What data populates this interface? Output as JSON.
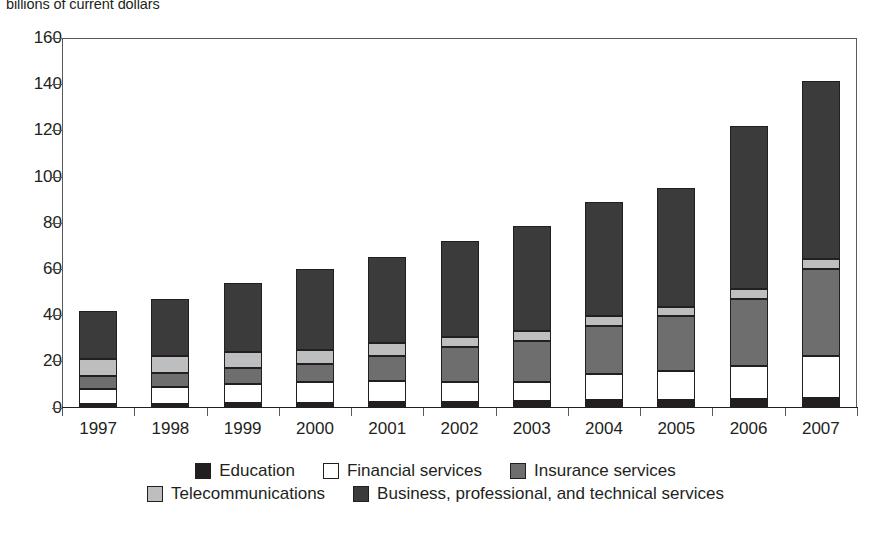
{
  "caption": "billions of current dollars",
  "axis": {
    "y_ticks": [
      0,
      20,
      40,
      60,
      80,
      100,
      120,
      140,
      160
    ],
    "y_min": 0,
    "y_max": 160
  },
  "legend": {
    "rows": [
      [
        {
          "label": "Education",
          "color": "#231f20",
          "key": "education"
        },
        {
          "label": "Financial services",
          "color": "#ffffff",
          "key": "financial-services"
        },
        {
          "label": "Insurance services",
          "color": "#6e6e6e",
          "key": "insurance-services"
        }
      ],
      [
        {
          "label": "Telecommunications",
          "color": "#bcbec0",
          "key": "telecommunications"
        },
        {
          "label": "Business, professional, and technical services",
          "color": "#3b3b3b",
          "key": "business-professional-technical-services"
        }
      ]
    ]
  },
  "chart_data": {
    "type": "bar",
    "stacked": true,
    "title": "",
    "subtitle": "billions of current dollars",
    "xlabel": "",
    "ylabel": "billions of current dollars",
    "ylim": [
      0,
      160
    ],
    "ytick_step": 20,
    "grid": false,
    "legend_position": "bottom",
    "categories": [
      "1997",
      "1998",
      "1999",
      "2000",
      "2001",
      "2002",
      "2003",
      "2004",
      "2005",
      "2006",
      "2007"
    ],
    "series": [
      {
        "name": "Education",
        "color": "#231f20",
        "values": [
          1.5,
          1.6,
          1.8,
          2.0,
          2.2,
          2.5,
          2.8,
          3.1,
          3.4,
          3.8,
          4.2
        ]
      },
      {
        "name": "Financial services",
        "color": "#ffffff",
        "values": [
          6.5,
          7.4,
          8.2,
          9.0,
          9.3,
          8.5,
          8.2,
          11.4,
          12.3,
          14.2,
          18.3
        ]
      },
      {
        "name": "Insurance services",
        "color": "#6e6e6e",
        "values": [
          5.5,
          6.0,
          7.0,
          8.0,
          11.0,
          15.0,
          18.0,
          21.0,
          24.0,
          29.0,
          37.5
        ]
      },
      {
        "name": "Telecommunications",
        "color": "#bcbec0",
        "values": [
          7.5,
          7.5,
          7.0,
          6.0,
          5.5,
          4.5,
          4.0,
          4.0,
          4.0,
          4.5,
          4.5
        ]
      },
      {
        "name": "Business, professional, and technical services",
        "color": "#3b3b3b",
        "values": [
          21.0,
          24.5,
          30.0,
          35.0,
          37.0,
          41.5,
          45.5,
          49.5,
          51.5,
          70.5,
          77.0
        ]
      }
    ],
    "totals": [
      42.0,
      47.0,
      54.0,
      60.0,
      65.0,
      72.0,
      78.5,
      89.0,
      95.2,
      122.0,
      141.5
    ]
  }
}
